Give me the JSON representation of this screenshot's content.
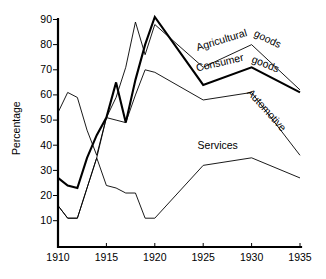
{
  "chart_data": {
    "type": "line",
    "title": "",
    "xlabel": "",
    "ylabel": "Percentage",
    "xlim": [
      1910,
      1935
    ],
    "ylim": [
      0,
      90
    ],
    "grid": false,
    "legend_position": "inline-right",
    "xticks": [
      1910,
      1915,
      1920,
      1925,
      1930,
      1935
    ],
    "yticks": [
      10,
      20,
      30,
      40,
      50,
      60,
      70,
      80,
      90
    ],
    "x": [
      1910,
      1911,
      1912,
      1913,
      1914,
      1915,
      1916,
      1917,
      1918,
      1919,
      1920,
      1925,
      1930,
      1935
    ],
    "series": [
      {
        "name": "Agricultural goods",
        "style": "thin",
        "values": [
          53,
          61,
          59,
          46,
          36,
          51,
          59,
          71,
          89,
          76,
          88,
          71,
          80,
          62
        ]
      },
      {
        "name": "Consumer goods",
        "style": "thick",
        "values": [
          27,
          24,
          23,
          35,
          44,
          51,
          65,
          49,
          66,
          80,
          91,
          64,
          71,
          61
        ]
      },
      {
        "name": "Automotive",
        "style": "thin",
        "values": [
          16,
          11,
          11,
          23,
          35,
          51,
          50,
          49,
          60,
          70,
          69,
          58,
          61,
          36
        ]
      },
      {
        "name": "Services",
        "style": "thin",
        "values": [
          16,
          11,
          11,
          23,
          35,
          24,
          23,
          21,
          21,
          11,
          11,
          32,
          35,
          27
        ]
      }
    ],
    "annotations": [
      {
        "text": "Agricultural",
        "x": 1927.0,
        "y": 80.5,
        "rotation": -17
      },
      {
        "text": "goods",
        "x": 1931.5,
        "y": 81.0,
        "rotation": 26
      },
      {
        "text": "Consumer",
        "x": 1926.8,
        "y": 71.5,
        "rotation": -13
      },
      {
        "text": "goods",
        "x": 1931.3,
        "y": 71.0,
        "rotation": 22
      },
      {
        "text": "Automotive",
        "x": 1931.3,
        "y": 53.0,
        "rotation": 48
      },
      {
        "text": "Services",
        "x": 1926.5,
        "y": 38.5,
        "rotation": 0
      }
    ]
  },
  "axes": {
    "ylabel": "Percentage",
    "xticks": [
      "1910",
      "1915",
      "1920",
      "1925",
      "1930",
      "1935"
    ],
    "yticks": [
      "90",
      "80",
      "70",
      "60",
      "50",
      "40",
      "30",
      "20",
      "10"
    ]
  },
  "series_labels": {
    "agricultural_1": "Agricultural",
    "agricultural_2": "goods",
    "consumer_1": "Consumer",
    "consumer_2": "goods",
    "automotive": "Automotive",
    "services": "Services"
  },
  "colors": {
    "ink": "#000000",
    "background": "#ffffff"
  }
}
